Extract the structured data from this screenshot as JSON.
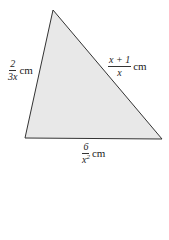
{
  "diagram": {
    "type": "triangle",
    "fill_color": "#e8e8e8",
    "stroke_color": "#333333",
    "vertices": {
      "top": [
        53,
        10
      ],
      "bottom_left": [
        25,
        138
      ],
      "bottom_right": [
        162,
        139
      ]
    },
    "sides": {
      "left": {
        "numerator": "2",
        "denominator": "3x",
        "unit": "cm"
      },
      "right": {
        "numerator": "x + 1",
        "denominator": "x",
        "unit": "cm"
      },
      "bottom": {
        "numerator": "6",
        "denominator_base": "x",
        "denominator_exp": "2",
        "unit": "cm"
      }
    }
  }
}
